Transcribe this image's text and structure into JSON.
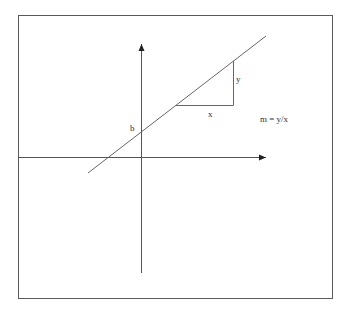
{
  "diagram": {
    "colors": {
      "background": "#ffffff",
      "frame": "#5a5a5a",
      "axis": "#555555",
      "line": "#666666",
      "text": "#333333"
    },
    "frame": {
      "x1": 18,
      "y1": 15,
      "x2": 333,
      "y2": 299
    },
    "axes": {
      "x_axis": {
        "x1": 19,
        "y": 157,
        "x2": 268,
        "arrow": true
      },
      "y_axis": {
        "x": 141,
        "y1": 273,
        "y2": 42,
        "arrow": true
      }
    },
    "line": {
      "x1": 88,
      "y1": 173,
      "x2": 266,
      "y2": 36
    },
    "slope_triangle": {
      "left": {
        "x": 176,
        "y": 105
      },
      "corner": {
        "x": 233,
        "y": 105
      },
      "top": {
        "x": 233,
        "y": 61
      }
    },
    "labels": {
      "intercept": "b",
      "rise": "y",
      "run": "x",
      "formula": "m = y/x"
    }
  }
}
